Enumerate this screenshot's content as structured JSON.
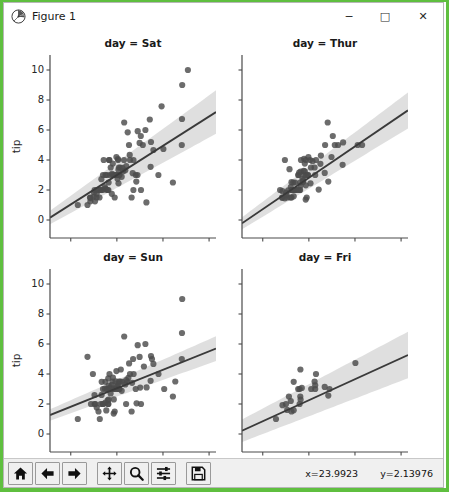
{
  "window": {
    "title": "Figure 1",
    "icon": "matplotlib-logo-icon",
    "minimize_label": "─",
    "maximize_label": "□",
    "close_label": "✕",
    "border_color": "#5fbf3f"
  },
  "toolbar": {
    "buttons": [
      {
        "name": "home-icon",
        "tooltip": "Reset original view"
      },
      {
        "name": "back-arrow-icon",
        "tooltip": "Back to previous view"
      },
      {
        "name": "forward-arrow-icon",
        "tooltip": "Forward to next view"
      },
      {
        "name": "pan-move-icon",
        "tooltip": "Pan axes with left mouse, zoom with right"
      },
      {
        "name": "zoom-magnifier-icon",
        "tooltip": "Zoom to rectangle"
      },
      {
        "name": "configure-subplots-icon",
        "tooltip": "Configure subplots"
      },
      {
        "name": "save-floppy-icon",
        "tooltip": "Save the figure"
      }
    ],
    "coord_x": "x=23.9923",
    "coord_y": "y=2.13976"
  },
  "chart_data": {
    "type": "scatter",
    "title": "",
    "figure_kind": "seaborn lmplot facet grid (2x2)",
    "xlabel": "total_bill",
    "ylabel": "tip",
    "xlim": [
      -9,
      63
    ],
    "ylim": [
      -1.2,
      11.0
    ],
    "xticks": [
      0,
      20,
      40,
      60
    ],
    "yticks": [
      0,
      2,
      4,
      6,
      8,
      10
    ],
    "grid": false,
    "legend": null,
    "point_color": "#4c4c4c",
    "line_color": "#3a3a3a",
    "ci_band_color": "#d9d9d9",
    "facets": [
      {
        "title": "day = Sat",
        "position": "top-left",
        "regression": {
          "slope": 0.0977,
          "intercept": 1.04,
          "ci_half_width_at_x0": 0.45,
          "ci_half_width_at_x60": 1.45
        },
        "points": [
          [
            3.07,
            1.0
          ],
          [
            7.25,
            1.0
          ],
          [
            8.35,
            1.5
          ],
          [
            8.51,
            1.25
          ],
          [
            8.52,
            1.48
          ],
          [
            9.94,
            1.56
          ],
          [
            10.07,
            1.83
          ],
          [
            10.33,
            2.0
          ],
          [
            10.51,
            1.25
          ],
          [
            11.17,
            1.5
          ],
          [
            11.24,
            1.76
          ],
          [
            11.38,
            2.0
          ],
          [
            12.26,
            2.0
          ],
          [
            12.46,
            1.5
          ],
          [
            13.0,
            2.0
          ],
          [
            13.13,
            2.0
          ],
          [
            13.28,
            2.72
          ],
          [
            13.81,
            2.0
          ],
          [
            14.0,
            3.0
          ],
          [
            14.31,
            4.0
          ],
          [
            14.73,
            2.2
          ],
          [
            15.01,
            2.09
          ],
          [
            15.06,
            3.0
          ],
          [
            15.48,
            2.02
          ],
          [
            15.69,
            3.0
          ],
          [
            16.0,
            2.0
          ],
          [
            16.31,
            2.0
          ],
          [
            16.4,
            2.5
          ],
          [
            16.58,
            4.0
          ],
          [
            16.82,
            4.0
          ],
          [
            17.07,
            3.0
          ],
          [
            17.31,
            3.5
          ],
          [
            17.82,
            1.75
          ],
          [
            17.92,
            3.08
          ],
          [
            18.24,
            3.76
          ],
          [
            18.29,
            3.0
          ],
          [
            18.78,
            3.0
          ],
          [
            19.08,
            1.5
          ],
          [
            19.44,
            3.0
          ],
          [
            19.65,
            3.0
          ],
          [
            19.81,
            4.19
          ],
          [
            20.29,
            2.75
          ],
          [
            20.45,
            3.0
          ],
          [
            20.49,
            4.06
          ],
          [
            20.53,
            4.0
          ],
          [
            20.65,
            3.35
          ],
          [
            20.69,
            2.45
          ],
          [
            20.9,
            3.5
          ],
          [
            21.01,
            3.0
          ],
          [
            21.16,
            3.0
          ],
          [
            21.5,
            3.5
          ],
          [
            22.12,
            2.88
          ],
          [
            22.42,
            3.48
          ],
          [
            22.75,
            3.25
          ],
          [
            23.1,
            4.0
          ],
          [
            23.17,
            6.5
          ],
          [
            23.68,
            3.31
          ],
          [
            24.06,
            3.6
          ],
          [
            24.71,
            5.85
          ],
          [
            25.28,
            5.0
          ],
          [
            25.56,
            4.34
          ],
          [
            25.71,
            4.0
          ],
          [
            26.41,
            1.5
          ],
          [
            26.88,
            3.12
          ],
          [
            27.18,
            2.0
          ],
          [
            27.2,
            4.0
          ],
          [
            28.15,
            3.0
          ],
          [
            28.44,
            2.56
          ],
          [
            28.97,
            3.0
          ],
          [
            29.03,
            5.92
          ],
          [
            29.85,
            5.14
          ],
          [
            30.4,
            5.6
          ],
          [
            30.46,
            2.0
          ],
          [
            31.27,
            5.0
          ],
          [
            32.4,
            6.0
          ],
          [
            32.83,
            1.17
          ],
          [
            34.3,
            6.7
          ],
          [
            34.63,
            3.55
          ],
          [
            34.81,
            5.2
          ],
          [
            35.83,
            4.67
          ],
          [
            38.01,
            3.0
          ],
          [
            39.42,
            7.58
          ],
          [
            40.17,
            4.73
          ],
          [
            44.3,
            2.5
          ],
          [
            48.17,
            5.0
          ],
          [
            48.27,
            6.73
          ],
          [
            48.33,
            9.0
          ],
          [
            50.81,
            10.0
          ]
        ]
      },
      {
        "title": "day = Thur",
        "position": "top-right",
        "regression": {
          "slope": 0.1045,
          "intercept": 0.72,
          "ci_half_width_at_x0": 0.4,
          "ci_half_width_at_x60": 1.2
        },
        "points": [
          [
            7.51,
            2.0
          ],
          [
            8.35,
            1.5
          ],
          [
            8.52,
            1.48
          ],
          [
            8.58,
            1.92
          ],
          [
            9.55,
            1.45
          ],
          [
            9.6,
            4.0
          ],
          [
            10.07,
            1.83
          ],
          [
            10.34,
            1.66
          ],
          [
            10.65,
            1.5
          ],
          [
            11.02,
            1.98
          ],
          [
            11.61,
            3.39
          ],
          [
            12.03,
            1.5
          ],
          [
            12.16,
            2.2
          ],
          [
            12.46,
            1.5
          ],
          [
            12.48,
            2.52
          ],
          [
            12.54,
            2.0
          ],
          [
            12.69,
            2.0
          ],
          [
            13.0,
            2.0
          ],
          [
            13.03,
            2.0
          ],
          [
            13.13,
            2.0
          ],
          [
            13.27,
            2.5
          ],
          [
            13.42,
            1.58
          ],
          [
            13.51,
            2.0
          ],
          [
            13.81,
            2.0
          ],
          [
            14.07,
            2.5
          ],
          [
            14.15,
            2.0
          ],
          [
            14.52,
            2.0
          ],
          [
            15.38,
            3.0
          ],
          [
            15.48,
            2.02
          ],
          [
            15.53,
            3.0
          ],
          [
            15.81,
            3.16
          ],
          [
            16.0,
            2.0
          ],
          [
            16.21,
            2.0
          ],
          [
            16.27,
            2.5
          ],
          [
            16.43,
            2.3
          ],
          [
            16.47,
            3.23
          ],
          [
            16.58,
            4.0
          ],
          [
            17.26,
            2.74
          ],
          [
            17.46,
            2.54
          ],
          [
            17.59,
            2.64
          ],
          [
            17.78,
            3.27
          ],
          [
            17.92,
            4.08
          ],
          [
            18.04,
            3.0
          ],
          [
            18.24,
            3.76
          ],
          [
            18.26,
            3.25
          ],
          [
            18.64,
            1.36
          ],
          [
            18.69,
            2.31
          ],
          [
            18.71,
            4.0
          ],
          [
            18.78,
            3.0
          ],
          [
            19.08,
            1.5
          ],
          [
            19.44,
            3.0
          ],
          [
            19.65,
            3.0
          ],
          [
            19.81,
            4.19
          ],
          [
            20.53,
            4.0
          ],
          [
            20.69,
            2.45
          ],
          [
            20.9,
            3.5
          ],
          [
            21.58,
            3.92
          ],
          [
            22.49,
            3.5
          ],
          [
            22.76,
            3.0
          ],
          [
            23.1,
            4.0
          ],
          [
            24.27,
            2.03
          ],
          [
            25.0,
            3.75
          ],
          [
            25.21,
            4.29
          ],
          [
            26.86,
            3.14
          ],
          [
            27.05,
            5.0
          ],
          [
            28.17,
            6.5
          ],
          [
            28.44,
            2.56
          ],
          [
            29.8,
            4.2
          ],
          [
            30.4,
            5.6
          ],
          [
            31.27,
            5.0
          ],
          [
            32.68,
            5.0
          ],
          [
            34.65,
            3.68
          ],
          [
            34.83,
            5.17
          ],
          [
            41.19,
            5.0
          ],
          [
            43.11,
            5.0
          ]
        ]
      },
      {
        "title": "day = Sun",
        "position": "bottom-left",
        "regression": {
          "slope": 0.0615,
          "intercept": 1.82,
          "ci_half_width_at_x0": 0.38,
          "ci_half_width_at_x60": 0.82
        },
        "points": [
          [
            3.07,
            1.0
          ],
          [
            7.25,
            5.15
          ],
          [
            8.77,
            2.0
          ],
          [
            9.6,
            4.0
          ],
          [
            10.29,
            2.6
          ],
          [
            10.33,
            2.0
          ],
          [
            10.63,
            2.0
          ],
          [
            11.24,
            1.76
          ],
          [
            12.03,
            1.5
          ],
          [
            12.6,
            1.0
          ],
          [
            13.0,
            2.0
          ],
          [
            13.39,
            2.61
          ],
          [
            13.42,
            3.48
          ],
          [
            13.81,
            2.0
          ],
          [
            14.0,
            3.0
          ],
          [
            14.15,
            2.0
          ],
          [
            14.83,
            3.02
          ],
          [
            15.01,
            2.09
          ],
          [
            15.04,
            3.48
          ],
          [
            15.42,
            1.57
          ],
          [
            15.69,
            3.0
          ],
          [
            15.98,
            3.0
          ],
          [
            16.04,
            2.24
          ],
          [
            16.21,
            2.0
          ],
          [
            16.29,
            3.71
          ],
          [
            16.31,
            2.0
          ],
          [
            16.43,
            2.3
          ],
          [
            16.47,
            3.23
          ],
          [
            16.82,
            4.0
          ],
          [
            16.93,
            3.07
          ],
          [
            17.07,
            3.0
          ],
          [
            17.29,
            2.71
          ],
          [
            17.51,
            3.0
          ],
          [
            17.78,
            3.27
          ],
          [
            17.92,
            3.08
          ],
          [
            18.15,
            3.5
          ],
          [
            18.29,
            3.76
          ],
          [
            18.43,
            3.0
          ],
          [
            18.64,
            1.36
          ],
          [
            18.69,
            2.31
          ],
          [
            18.78,
            3.0
          ],
          [
            19.08,
            1.5
          ],
          [
            19.49,
            3.51
          ],
          [
            19.65,
            3.0
          ],
          [
            19.81,
            4.19
          ],
          [
            20.08,
            3.15
          ],
          [
            20.29,
            3.21
          ],
          [
            20.45,
            3.0
          ],
          [
            20.65,
            3.35
          ],
          [
            20.9,
            3.5
          ],
          [
            21.01,
            3.0
          ],
          [
            21.16,
            3.0
          ],
          [
            21.5,
            3.5
          ],
          [
            21.7,
            4.3
          ],
          [
            22.12,
            2.88
          ],
          [
            22.42,
            3.48
          ],
          [
            23.17,
            6.5
          ],
          [
            23.68,
            3.31
          ],
          [
            24.01,
            2.0
          ],
          [
            24.06,
            3.6
          ],
          [
            24.52,
            3.48
          ],
          [
            25.0,
            3.75
          ],
          [
            25.29,
            4.71
          ],
          [
            25.71,
            4.0
          ],
          [
            26.41,
            1.5
          ],
          [
            26.59,
            3.41
          ],
          [
            27.05,
            5.0
          ],
          [
            27.28,
            4.0
          ],
          [
            28.15,
            3.0
          ],
          [
            28.55,
            2.05
          ],
          [
            29.03,
            5.92
          ],
          [
            29.85,
            5.14
          ],
          [
            30.14,
            3.09
          ],
          [
            30.46,
            2.0
          ],
          [
            31.71,
            4.5
          ],
          [
            32.4,
            6.0
          ],
          [
            32.9,
            3.11
          ],
          [
            34.63,
            3.55
          ],
          [
            34.81,
            5.2
          ],
          [
            35.26,
            5.0
          ],
          [
            35.83,
            4.67
          ],
          [
            38.07,
            4.0
          ],
          [
            40.55,
            3.0
          ],
          [
            44.3,
            2.5
          ],
          [
            45.35,
            3.5
          ],
          [
            48.17,
            5.0
          ],
          [
            48.27,
            6.73
          ],
          [
            48.33,
            9.0
          ]
        ]
      },
      {
        "title": "day = Fri",
        "position": "bottom-right",
        "regression": {
          "slope": 0.0701,
          "intercept": 0.85,
          "ci_half_width_at_x0": 0.75,
          "ci_half_width_at_x60": 1.55
        },
        "points": [
          [
            5.75,
            1.0
          ],
          [
            8.58,
            1.92
          ],
          [
            10.09,
            2.0
          ],
          [
            10.59,
            1.61
          ],
          [
            11.35,
            2.5
          ],
          [
            12.16,
            2.2
          ],
          [
            12.46,
            1.5
          ],
          [
            13.42,
            1.58
          ],
          [
            13.42,
            3.48
          ],
          [
            15.38,
            3.0
          ],
          [
            15.98,
            3.0
          ],
          [
            16.0,
            2.0
          ],
          [
            16.27,
            2.5
          ],
          [
            16.32,
            4.3
          ],
          [
            16.43,
            2.3
          ],
          [
            16.93,
            3.07
          ],
          [
            21.01,
            3.0
          ],
          [
            22.49,
            3.5
          ],
          [
            22.75,
            3.25
          ],
          [
            22.76,
            3.0
          ],
          [
            23.1,
            4.0
          ],
          [
            26.86,
            3.14
          ],
          [
            28.97,
            3.0
          ],
          [
            28.44,
            2.56
          ],
          [
            40.17,
            4.73
          ]
        ]
      }
    ]
  }
}
